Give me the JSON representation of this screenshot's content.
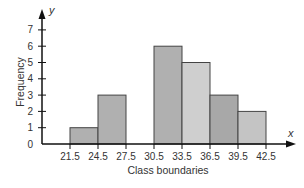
{
  "chart_data": {
    "type": "bar",
    "subtype": "histogram",
    "title": "",
    "xlabel": "Class boundaries",
    "ylabel": "Frequency",
    "x_axis_variable": "x",
    "y_axis_variable": "y",
    "class_boundaries": [
      "21.5",
      "24.5",
      "27.5",
      "30.5",
      "33.5",
      "36.5",
      "39.5",
      "42.5"
    ],
    "categories": [
      "21.5-24.5",
      "24.5-27.5",
      "27.5-30.5",
      "30.5-33.5",
      "33.5-36.5",
      "36.5-39.5",
      "39.5-42.5"
    ],
    "values": [
      1,
      3,
      0,
      6,
      5,
      3,
      2
    ],
    "bar_colors": [
      "#b0b0b0",
      "#b0b0b0",
      "#b0b0b0",
      "#b0b0b0",
      "#cfcfcf",
      "#a8a8a8",
      "#c4c4c4"
    ],
    "y_ticks": [
      "0",
      "1",
      "2",
      "3",
      "4",
      "5",
      "6",
      "7"
    ],
    "ylim": [
      0,
      7
    ],
    "grid": false,
    "legend": null
  }
}
